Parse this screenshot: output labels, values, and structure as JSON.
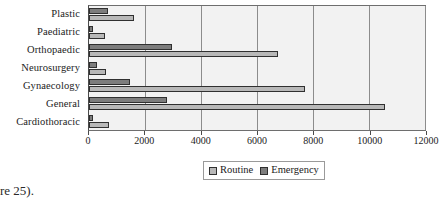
{
  "chart_data": {
    "type": "bar",
    "orientation": "horizontal",
    "title": "",
    "xlabel": "",
    "ylabel": "",
    "categories": [
      "Plastic",
      "Paediatric",
      "Orthopaedic",
      "Neurosurgery",
      "Gynaecology",
      "General",
      "Cardiothoracic"
    ],
    "series": [
      {
        "name": "Routine",
        "color": "#b8b8b8",
        "values": [
          1600,
          560,
          6750,
          600,
          7700,
          10580,
          700
        ]
      },
      {
        "name": "Emergency",
        "color": "#7d7d7d",
        "values": [
          680,
          150,
          2980,
          280,
          1450,
          2800,
          140
        ]
      }
    ],
    "xlim": [
      0,
      12000
    ],
    "xticks": [
      0,
      2000,
      4000,
      6000,
      8000,
      10000,
      12000
    ],
    "xtick_labels": [
      "0",
      "2000",
      "4000",
      "6000",
      "8000",
      "10000",
      "12000"
    ],
    "grid": "vertical",
    "legend_position": "bottom",
    "plot_background": "#f2f2f2"
  },
  "legend": {
    "entries": [
      {
        "label": "Routine"
      },
      {
        "label": "Emergency"
      }
    ]
  },
  "caption": {
    "fragment": "re 25)."
  }
}
